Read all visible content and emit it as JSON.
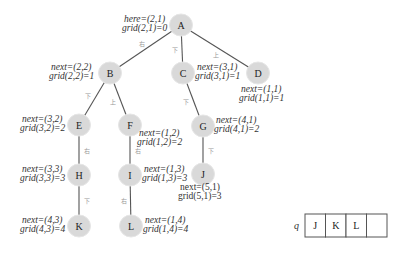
{
  "diagram": {
    "type": "bfs-search-tree",
    "nodes": [
      {
        "id": "A",
        "x": 181,
        "y": 25
      },
      {
        "id": "B",
        "x": 110,
        "y": 73
      },
      {
        "id": "C",
        "x": 183,
        "y": 73
      },
      {
        "id": "D",
        "x": 258,
        "y": 73
      },
      {
        "id": "E",
        "x": 79,
        "y": 125
      },
      {
        "id": "F",
        "x": 130,
        "y": 125
      },
      {
        "id": "G",
        "x": 203,
        "y": 126
      },
      {
        "id": "H",
        "x": 79,
        "y": 175
      },
      {
        "id": "I",
        "x": 130,
        "y": 175
      },
      {
        "id": "J",
        "x": 203,
        "y": 174
      },
      {
        "id": "K",
        "x": 79,
        "y": 226
      },
      {
        "id": "L",
        "x": 131,
        "y": 226
      }
    ],
    "edges": [
      {
        "from": "A",
        "to": "B",
        "label": "右"
      },
      {
        "from": "A",
        "to": "C",
        "label": "下"
      },
      {
        "from": "A",
        "to": "D",
        "label": "上"
      },
      {
        "from": "B",
        "to": "E",
        "label": "下"
      },
      {
        "from": "B",
        "to": "F",
        "label": "上"
      },
      {
        "from": "C",
        "to": "G",
        "label": "下"
      },
      {
        "from": "E",
        "to": "H",
        "label": "右"
      },
      {
        "from": "F",
        "to": "I",
        "label": "右"
      },
      {
        "from": "G",
        "to": "J",
        "label": "下"
      },
      {
        "from": "H",
        "to": "K",
        "label": "下"
      },
      {
        "from": "I",
        "to": "L",
        "label": "右"
      }
    ],
    "annotations": [
      {
        "node": "A",
        "line1": "here=(2,1)",
        "line2": "grid(2,1)=0",
        "x": 124,
        "y": 22,
        "italic": true
      },
      {
        "node": "B",
        "line1": "next=(2,2)",
        "line2": "grid(2,2)=1",
        "x": 51,
        "y": 70,
        "italic": true
      },
      {
        "node": "C",
        "line1": "next=(3,1)",
        "line2": "grid(3,1)=1",
        "x": 197,
        "y": 70,
        "italic": true
      },
      {
        "node": "D",
        "line1": "next=(1,1)",
        "line2": "grid(1,1)=1",
        "x": 241,
        "y": 92,
        "italic": true
      },
      {
        "node": "E",
        "line1": "next=(3,2)",
        "line2": "grid(3,2)=2",
        "x": 22,
        "y": 122,
        "italic": true
      },
      {
        "node": "F",
        "line1": "next=(1,2)",
        "line2": "grid(1,2)=2",
        "x": 139,
        "y": 136,
        "italic": true
      },
      {
        "node": "G",
        "line1": "next=(4,1)",
        "line2": "grid(4,1)=2",
        "x": 216,
        "y": 123,
        "italic": true
      },
      {
        "node": "H",
        "line1": "next=(3,3)",
        "line2": "grid(3,3)=3",
        "x": 22,
        "y": 172,
        "italic": true
      },
      {
        "node": "I",
        "line1": "next=(1,3)",
        "line2": "grid(1,3)=3",
        "x": 144,
        "y": 172,
        "italic": true
      },
      {
        "node": "J",
        "line1": "next=(5,1)",
        "line2": "grid(5,1)=3",
        "x": 180,
        "y": 190,
        "italic": false
      },
      {
        "node": "K",
        "line1": "next=(4,3)",
        "line2": "grid(4,3)=4",
        "x": 22,
        "y": 223,
        "italic": true
      },
      {
        "node": "L",
        "line1": "next=(1,4)",
        "line2": "grid(1,4)=4",
        "x": 145,
        "y": 223,
        "italic": true
      }
    ],
    "queue": {
      "label": "q",
      "cells": [
        "J",
        "K",
        "L",
        ""
      ]
    }
  }
}
